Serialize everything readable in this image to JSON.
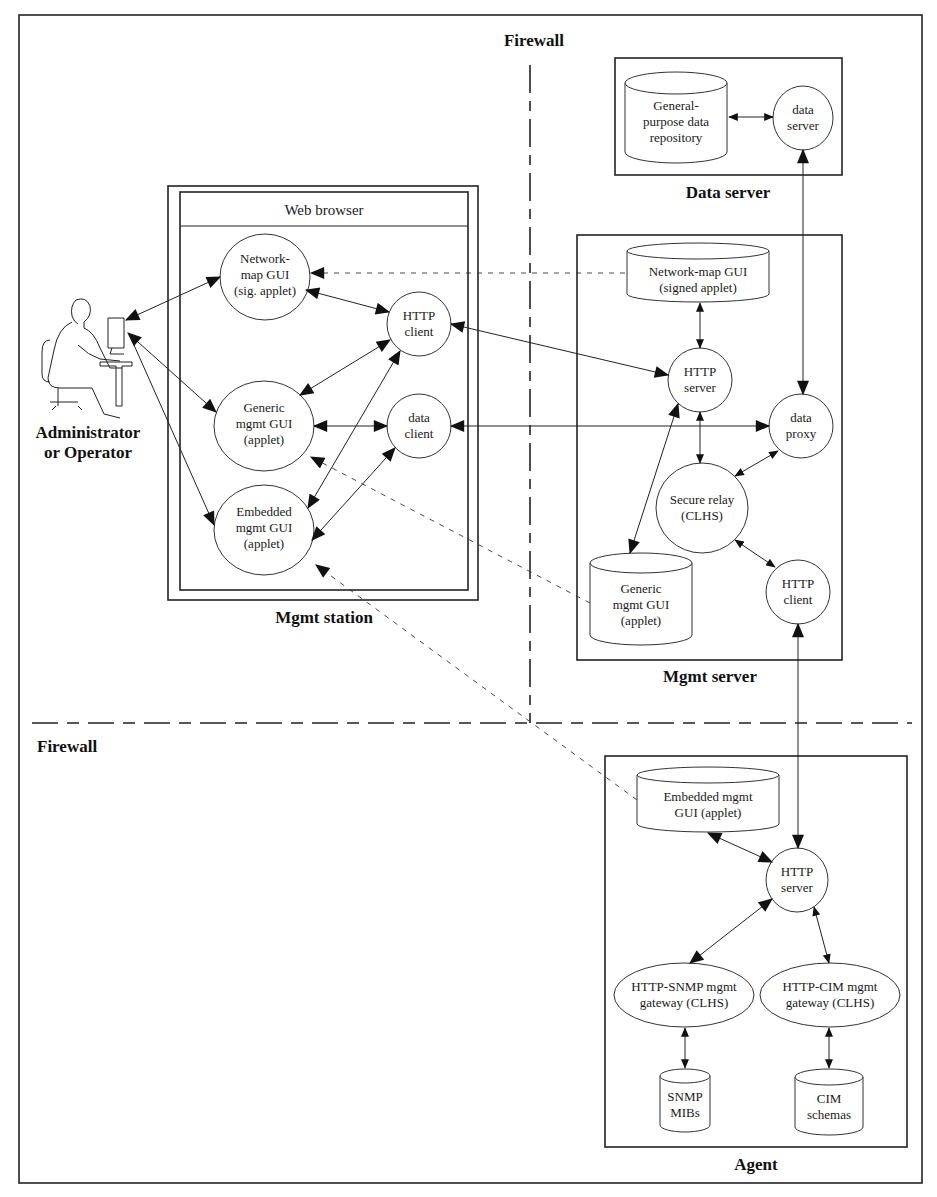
{
  "firewalls": {
    "vertical_label": "Firewall",
    "horizontal_label": "Firewall"
  },
  "actor": {
    "line1": "Administrator",
    "line2": "or Operator"
  },
  "mgmt_station": {
    "label": "Mgmt station",
    "browser_title": "Web browser",
    "network_map_gui": [
      "Network-",
      "map GUI",
      "(sig. applet)"
    ],
    "generic_gui": [
      "Generic",
      "mgmt GUI",
      "(applet)"
    ],
    "embedded_gui": [
      "Embedded",
      "mgmt GUI",
      "(applet)"
    ],
    "http_client": [
      "HTTP",
      "client"
    ],
    "data_client": [
      "data",
      "client"
    ]
  },
  "data_server": {
    "label": "Data server",
    "repository": [
      "General-",
      "purpose data",
      "repository"
    ],
    "server": [
      "data",
      "server"
    ]
  },
  "mgmt_server": {
    "label": "Mgmt server",
    "network_map_store": [
      "Network-map GUI",
      "(signed applet)"
    ],
    "http_server": [
      "HTTP",
      "server"
    ],
    "data_proxy": [
      "data",
      "proxy"
    ],
    "secure_relay": [
      "Secure relay",
      "(CLHS)"
    ],
    "generic_gui_store": [
      "Generic",
      "mgmt GUI",
      "(applet)"
    ],
    "http_client": [
      "HTTP",
      "client"
    ]
  },
  "agent": {
    "label": "Agent",
    "embedded_gui_store": [
      "Embedded mgmt",
      "GUI (applet)"
    ],
    "http_server": [
      "HTTP",
      "server"
    ],
    "snmp_gateway": [
      "HTTP-SNMP mgmt",
      "gateway (CLHS)"
    ],
    "cim_gateway": [
      "HTTP-CIM mgmt",
      "gateway (CLHS)"
    ],
    "snmp_mibs": [
      "SNMP",
      "MIBs"
    ],
    "cim_schemas": [
      "CIM",
      "schemas"
    ]
  }
}
